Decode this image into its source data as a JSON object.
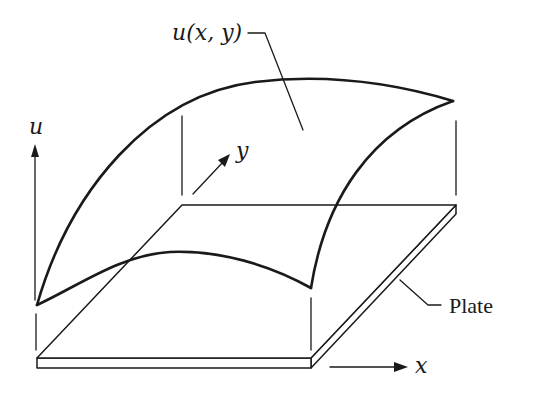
{
  "diagram": {
    "title": "",
    "labels": {
      "surface": "u(x, y)",
      "u_axis": "u",
      "y_axis": "y",
      "x_axis": "x",
      "plate": "Plate"
    },
    "colors": {
      "stroke": "#1a1a1a",
      "background": "#ffffff"
    },
    "elements": [
      {
        "id": "plate",
        "type": "rectangular-slab",
        "description": "Thin flat plate in oblique projection"
      },
      {
        "id": "surface",
        "type": "curved-surface",
        "description": "Deflection surface u(x, y) above the plate"
      },
      {
        "id": "u-axis",
        "type": "arrow",
        "direction": "up"
      },
      {
        "id": "y-axis",
        "type": "arrow",
        "direction": "into-page (oblique)"
      },
      {
        "id": "x-axis",
        "type": "arrow",
        "direction": "right"
      },
      {
        "id": "corner-projections",
        "type": "dashed-verticals",
        "count": 4
      }
    ]
  }
}
